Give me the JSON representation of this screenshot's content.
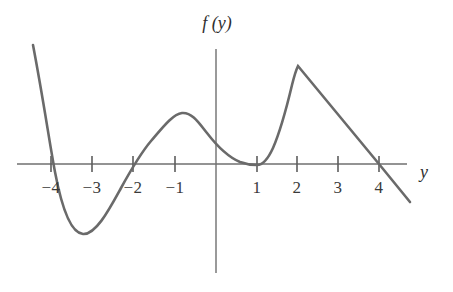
{
  "figure": {
    "width": 453,
    "height": 292,
    "background": "#ffffff"
  },
  "labels": {
    "vertical_axis_title": "f (y)",
    "horizontal_axis_title": "y"
  },
  "style": {
    "curve_color": "#6a6a6a",
    "axis_color": "#6f6f6f",
    "text_color": "#3a3a3a",
    "curve_width": 2.6,
    "axis_width": 1.4
  },
  "chart_data": {
    "type": "line",
    "title": "",
    "subtitle": "",
    "xlabel": "y",
    "ylabel": "f (y)",
    "grid": false,
    "legend": null,
    "xlim": [
      -4.9,
      4.7
    ],
    "ylim": [
      -2.1,
      3.0
    ],
    "xticks": [
      -4,
      -3,
      -2,
      -1,
      1,
      2,
      3,
      4
    ],
    "xtick_labels": [
      "−4",
      "−3",
      "−2",
      "−1",
      "1",
      "2",
      "3",
      "4"
    ],
    "yticks": [],
    "ytick_labels": [],
    "axis_origin_px": {
      "x": 216,
      "y": 164
    },
    "pixels_per_unit_x": 40.6,
    "pixels_per_unit_y": 40.6,
    "annotations": [
      "zero crossing at y = -4",
      "local minimum near y = -3.25",
      "zero crossing at y = -2",
      "local maximum near y = -0.85",
      "touches axis (double root) at y = 1",
      "sharp cusp peak at y = 2",
      "zero crossing at y = 4"
    ],
    "key_points": [
      {
        "x": -4.5,
        "y": 2.93,
        "note": "left end of curve"
      },
      {
        "x": -4.0,
        "y": 0.0,
        "note": "root"
      },
      {
        "x": -3.25,
        "y": -1.75,
        "note": "local minimum"
      },
      {
        "x": -2.0,
        "y": 0.0,
        "note": "root"
      },
      {
        "x": -0.85,
        "y": 1.26,
        "note": "local maximum"
      },
      {
        "x": 0.0,
        "y": 0.72,
        "note": "value at origin"
      },
      {
        "x": 1.0,
        "y": 0.0,
        "note": "tangential touch / double root"
      },
      {
        "x": 2.0,
        "y": 2.41,
        "note": "cusp peak"
      },
      {
        "x": 4.0,
        "y": 0.0,
        "note": "root"
      },
      {
        "x": 4.78,
        "y": -0.93,
        "note": "right end of curve"
      }
    ],
    "series": [
      {
        "name": "f",
        "points_px": "M 33 45 C 44 103, 49 140, 55 172 C 62 209, 71 233, 83 234 C 96 235, 110 208, 121 188 C 132 168, 140 154, 151 141 C 163 127, 173 114, 182 113 C 192 112, 199 123, 207 133 C 217 146, 228 157, 240 162 C 248 165, 252 165, 257 165 C 263 165, 268 159, 273 148 C 280 132, 287 106, 292 85 C 295 73, 297 68, 298 66 L 379 164 L 410 202"
      }
    ]
  }
}
